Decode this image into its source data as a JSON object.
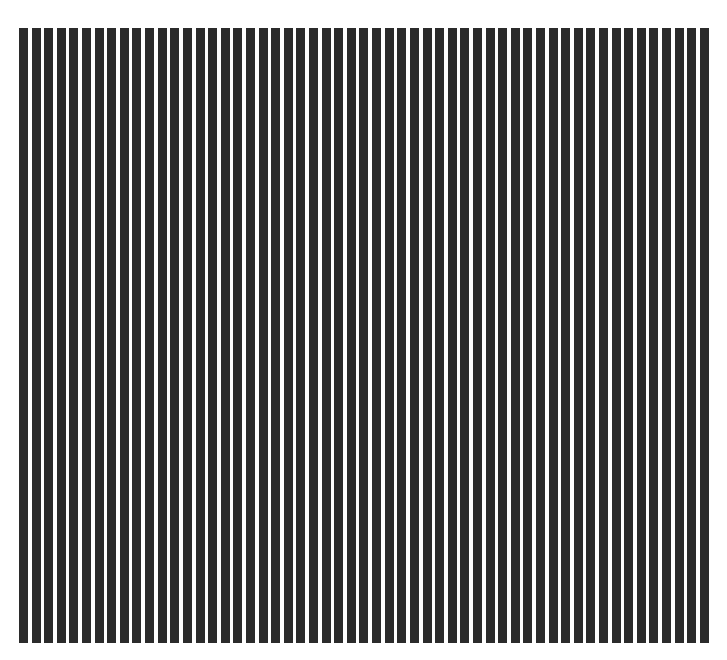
{
  "pattern": {
    "type": "vertical-stripes",
    "bar_count": 55,
    "bar_color": "#2b2b2b",
    "gap_color": "#ffffff",
    "background": "#ffffff"
  }
}
